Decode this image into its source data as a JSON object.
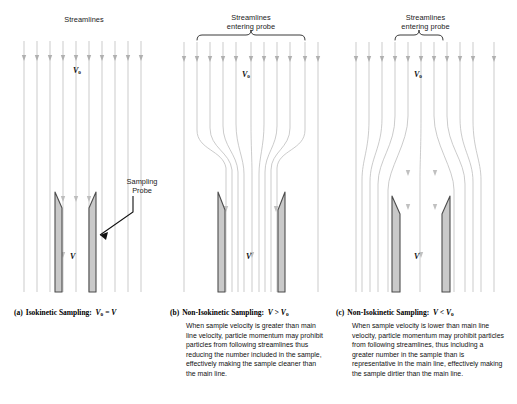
{
  "figure": {
    "colors": {
      "streamline": "#b9b9b9",
      "probe_fill": "#c9c9c9",
      "probe_stroke": "#555555",
      "text": "#111111",
      "background": "#ffffff"
    }
  },
  "panels": [
    {
      "id": "a",
      "header": "Streamlines",
      "caption_label": "(a)",
      "caption_text": "Isokinetic Sampling:",
      "caption_formula_main": "V",
      "caption_formula_sub": "o",
      "caption_formula_rel": "=",
      "caption_formula_right": "V",
      "velocity_top": "V",
      "velocity_top_sub": "o",
      "velocity_probe": "V",
      "annotation": "Sampling\nProbe",
      "annotation_line1": "Sampling",
      "annotation_line2": "Probe",
      "flow": "parallel",
      "body_text": ""
    },
    {
      "id": "b",
      "header_line1": "Streamlines",
      "header_line2": "entering probe",
      "caption_label": "(b)",
      "caption_text": "Non-Isokinetic Sampling:",
      "caption_formula_main": "V",
      "caption_formula_rel": ">",
      "caption_formula_right": "V",
      "caption_formula_right_sub": "o",
      "velocity_top": "V",
      "velocity_top_sub": "o",
      "velocity_probe": "V",
      "flow": "converging",
      "body_text": "When sample velocity is greater than main line velocity, particle momentum may prohibit particles from following streamlines thus reducing the number included in the sample, effectively making the sample cleaner than the main line."
    },
    {
      "id": "c",
      "header_line1": "Streamlines",
      "header_line2": "entering probe",
      "caption_label": "(c)",
      "caption_text": "Non-Isokinetic Sampling:",
      "caption_formula_main": "V",
      "caption_formula_rel": "<",
      "caption_formula_right": "V",
      "caption_formula_right_sub": "o",
      "velocity_top": "V",
      "velocity_top_sub": "o",
      "velocity_probe": "V",
      "flow": "diverging",
      "body_text": "When sample velocity is lower than main line velocity, particle momentum may prohibit particles from following streamlines, thus including a greater number in the sample than is representative in the main line, effectively making the sample dirtier than the main line."
    }
  ]
}
